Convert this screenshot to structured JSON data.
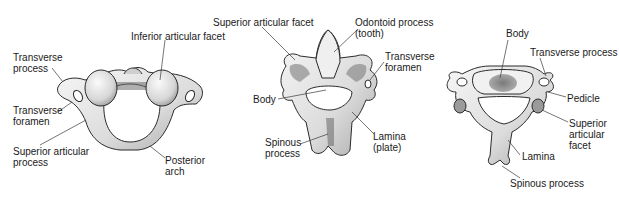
{
  "figure": {
    "panels": [
      {
        "id": "atlas",
        "labels": [
          {
            "lines": [
              "Transverse",
              "process"
            ],
            "x": 13,
            "y": 52
          },
          {
            "lines": [
              "Inferior articular facet"
            ],
            "x": 131,
            "y": 31
          },
          {
            "lines": [
              "Transverse",
              "foramen"
            ],
            "x": 13,
            "y": 105
          },
          {
            "lines": [
              "Superior articular",
              "process"
            ],
            "x": 13,
            "y": 146
          },
          {
            "lines": [
              "Posterior",
              "arch"
            ],
            "x": 165,
            "y": 155
          }
        ]
      },
      {
        "id": "axis",
        "labels": [
          {
            "lines": [
              "Superior articular facet"
            ],
            "x": 213,
            "y": 17
          },
          {
            "lines": [
              "Odontoid process",
              "(tooth)"
            ],
            "x": 355,
            "y": 17
          },
          {
            "lines": [
              "Transverse",
              "foramen"
            ],
            "x": 385,
            "y": 51
          },
          {
            "lines": [
              "Body"
            ],
            "x": 253,
            "y": 94
          },
          {
            "lines": [
              "Spinous",
              "process"
            ],
            "x": 265,
            "y": 137
          },
          {
            "lines": [
              "Lamina",
              "(plate)"
            ],
            "x": 373,
            "y": 131
          }
        ]
      },
      {
        "id": "typical-cervical",
        "labels": [
          {
            "lines": [
              "Body"
            ],
            "x": 506,
            "y": 28
          },
          {
            "lines": [
              "Transverse process"
            ],
            "x": 530,
            "y": 47
          },
          {
            "lines": [
              "Pedicle"
            ],
            "x": 567,
            "y": 93
          },
          {
            "lines": [
              "Superior",
              "articular",
              "facet"
            ],
            "x": 569,
            "y": 118
          },
          {
            "lines": [
              "Lamina"
            ],
            "x": 522,
            "y": 151
          },
          {
            "lines": [
              "Spinous process"
            ],
            "x": 510,
            "y": 178
          }
        ]
      }
    ],
    "colors": {
      "bone_fill": "#e9e9e9",
      "bone_shade": "#8c8c8c",
      "outline": "#2b2b2b",
      "text": "#1a1a1a",
      "background": "#ffffff"
    }
  }
}
